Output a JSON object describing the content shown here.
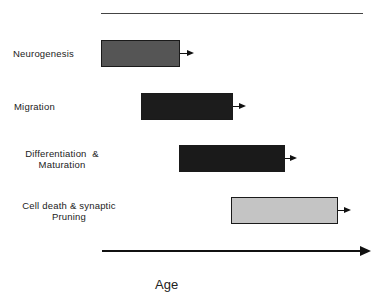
{
  "diagram": {
    "axis_label": "Age",
    "stages": [
      {
        "label_lines": [
          "Neurogenesis"
        ],
        "fill": "#555555"
      },
      {
        "label_lines": [
          "Migration"
        ],
        "fill": "#1c1c1c"
      },
      {
        "label_lines": [
          "Differentiation  &",
          "Maturation"
        ],
        "fill": "#1a1a1a"
      },
      {
        "label_lines": [
          "Cell death & synaptic",
          "Pruning"
        ],
        "fill": "#c4c4c4"
      }
    ]
  }
}
